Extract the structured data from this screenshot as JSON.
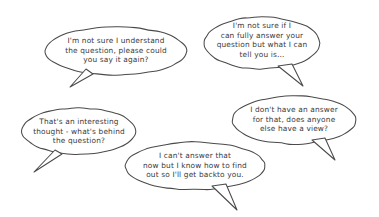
{
  "page": {
    "background_color": "#ffffff",
    "outline_color": "#4a4a4a",
    "text_color": "#3a3a3a",
    "width": 379,
    "height": 217
  },
  "bubbles": [
    {
      "id": "bubble-understand-question",
      "text": "I'm not sure I understand\nthe question, please could\nyou say it again?",
      "tail_direction": "down-left",
      "ellipse": {
        "cx": 116,
        "cy": 51,
        "rx": 71,
        "ry": 24
      },
      "text_box": {
        "left": 50,
        "top": 36,
        "width": 132
      },
      "tail_path": "M 86 69 L 70 87 L 93 74 Z"
    },
    {
      "id": "bubble-fully-answer",
      "text": "I'm not sure if I\ncan fully answer your\nquestion but what I can\ntell you is…",
      "tail_direction": "down-right",
      "ellipse": {
        "cx": 262,
        "cy": 43,
        "rx": 58,
        "ry": 26
      },
      "text_box": {
        "left": 207,
        "top": 21,
        "width": 110
      },
      "tail_path": "M 278 66 L 303 86 L 292 64 Z"
    },
    {
      "id": "bubble-no-answer-view",
      "text": "I don't have an answer\nfor that, does anyone\nelse have a view?",
      "tail_direction": "down-right",
      "ellipse": {
        "cx": 294,
        "cy": 120,
        "rx": 62,
        "ry": 24
      },
      "text_box": {
        "left": 236,
        "top": 105,
        "width": 116
      },
      "tail_path": "M 312 140 L 335 160 L 325 138 Z"
    },
    {
      "id": "bubble-interesting-thought",
      "text": "That's an interesting\nthought - what's behind\nthe question?",
      "tail_direction": "down-left",
      "ellipse": {
        "cx": 79,
        "cy": 131,
        "rx": 57,
        "ry": 23
      },
      "text_box": {
        "left": 24,
        "top": 117,
        "width": 110
      },
      "tail_path": "M 55 150 L 34 172 L 62 154 Z"
    },
    {
      "id": "bubble-get-back-to-you",
      "text": "I can't answer that\nnow but I know how to find\nout so I'll get backto you.",
      "tail_direction": "down-right",
      "ellipse": {
        "cx": 195,
        "cy": 166,
        "rx": 70,
        "ry": 24
      },
      "text_box": {
        "left": 128,
        "top": 151,
        "width": 134
      },
      "tail_path": "M 212 186 L 237 210 L 226 184 Z"
    }
  ]
}
